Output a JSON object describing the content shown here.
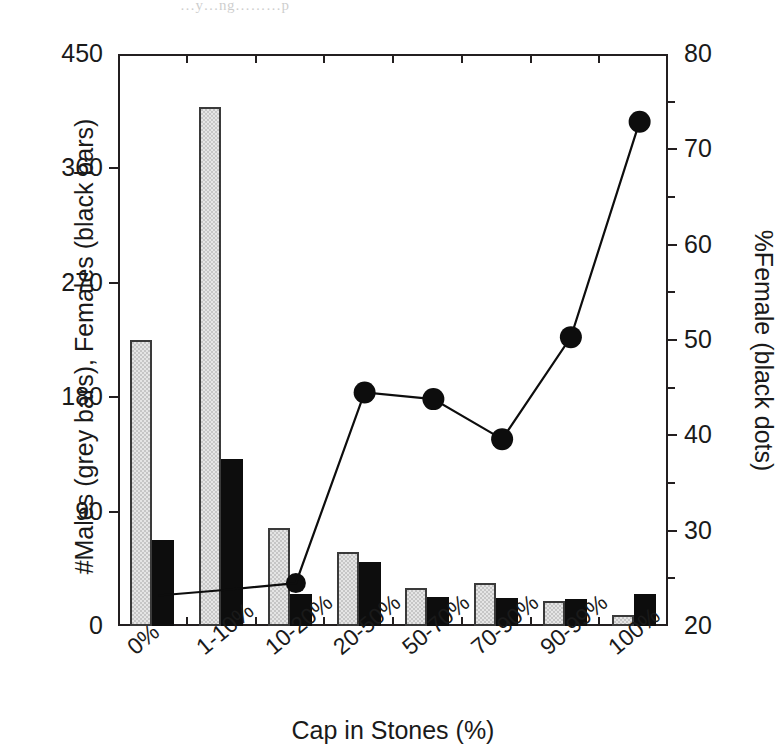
{
  "figure": {
    "top_artifact_text": "…y…ng………p"
  },
  "chart_data": {
    "type": "bar",
    "title": "",
    "subtitle": "",
    "xlabel": "Cap in Stones (%)",
    "ylabel": "#Males (grey bars), Females (black bars)",
    "y2label": "%Female (black dots)",
    "categories": [
      "0%",
      "1-10%",
      "10-20%",
      "20-50%",
      "50-70%",
      "70-90%",
      "90-99%",
      "100%"
    ],
    "ylim": [
      0,
      450
    ],
    "yticks": [
      0,
      90,
      180,
      270,
      360,
      450
    ],
    "y2lim": [
      20,
      80
    ],
    "y2ticks": [
      20,
      30,
      40,
      50,
      60,
      70,
      80
    ],
    "y2_minor_ticks": [
      25,
      35,
      45,
      55,
      65,
      75
    ],
    "x_minor_ticks": 8,
    "grid": false,
    "legend_position": "none",
    "series": [
      {
        "name": "#Males (grey bars)",
        "type": "bar",
        "axis": "left",
        "color": "#c6c6c6",
        "values": [
          225,
          408,
          77,
          58,
          30,
          34,
          20,
          9
        ]
      },
      {
        "name": "Females (black bars)",
        "type": "bar",
        "axis": "left",
        "color": "#0d0d0d",
        "values": [
          68,
          131,
          25,
          50,
          23,
          22,
          21,
          25
        ]
      },
      {
        "name": "%Female (black dots)",
        "type": "line",
        "axis": "right",
        "color": "#0d0d0d",
        "marker": "filled-circle",
        "values": [
          23.2,
          23.8,
          24.5,
          44.5,
          43.8,
          39.6,
          50.3,
          72.9
        ]
      }
    ]
  }
}
